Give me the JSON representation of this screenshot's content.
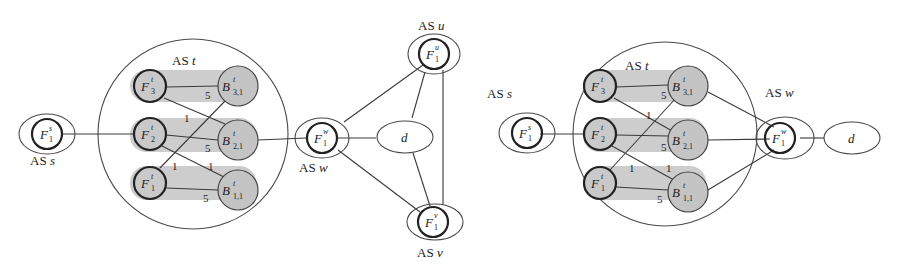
{
  "figure": {
    "left": {
      "as_labels": {
        "s": "AS s",
        "t": "AS t",
        "w": "AS w",
        "u": "AS u",
        "v": "AS v"
      },
      "destination": "d",
      "nodes": {
        "Fs1": {
          "base": "F",
          "sup": "s",
          "sub": "1"
        },
        "Ft3": {
          "base": "F",
          "sup": "t",
          "sub": "3"
        },
        "Ft2": {
          "base": "F",
          "sup": "t",
          "sub": "2"
        },
        "Ft1": {
          "base": "F",
          "sup": "t",
          "sub": "1"
        },
        "Bt31": {
          "base": "B",
          "sup": "t",
          "sub": "3,1"
        },
        "Bt21": {
          "base": "B",
          "sup": "t",
          "sub": "2,1"
        },
        "Bt11": {
          "base": "B",
          "sup": "t",
          "sub": "1,1"
        },
        "Fw1": {
          "base": "F",
          "sup": "w",
          "sub": "1"
        },
        "Fu1": {
          "base": "F",
          "sup": "u",
          "sub": "1"
        },
        "Fv1": {
          "base": "F",
          "sup": "v",
          "sub": "1"
        }
      },
      "edge_weights": {
        "F3_B31": "5",
        "F3_B21": "1",
        "F2_B21": "5",
        "F2_B11": "1",
        "F1_B31": "1",
        "F1_B11": "5"
      }
    },
    "right": {
      "as_labels": {
        "s": "AS s",
        "t": "AS t",
        "w": "AS w"
      },
      "destination": "d",
      "nodes": {
        "Fs1": {
          "base": "F",
          "sup": "s",
          "sub": "1"
        },
        "Ft3": {
          "base": "F",
          "sup": "t",
          "sub": "3"
        },
        "Ft2": {
          "base": "F",
          "sup": "t",
          "sub": "2"
        },
        "Ft1": {
          "base": "F",
          "sup": "t",
          "sub": "1"
        },
        "Bt31": {
          "base": "B",
          "sup": "t",
          "sub": "3,1"
        },
        "Bt21": {
          "base": "B",
          "sup": "t",
          "sub": "2,1"
        },
        "Bt11": {
          "base": "B",
          "sup": "t",
          "sub": "1,1"
        },
        "Fw1": {
          "base": "F",
          "sup": "w",
          "sub": "1"
        }
      },
      "edge_weights": {
        "F3_B31": "5",
        "F3_B21": "1",
        "F2_B21": "5",
        "F2_B11": "1",
        "F1_B31": "1",
        "F1_B11": "5"
      }
    }
  }
}
